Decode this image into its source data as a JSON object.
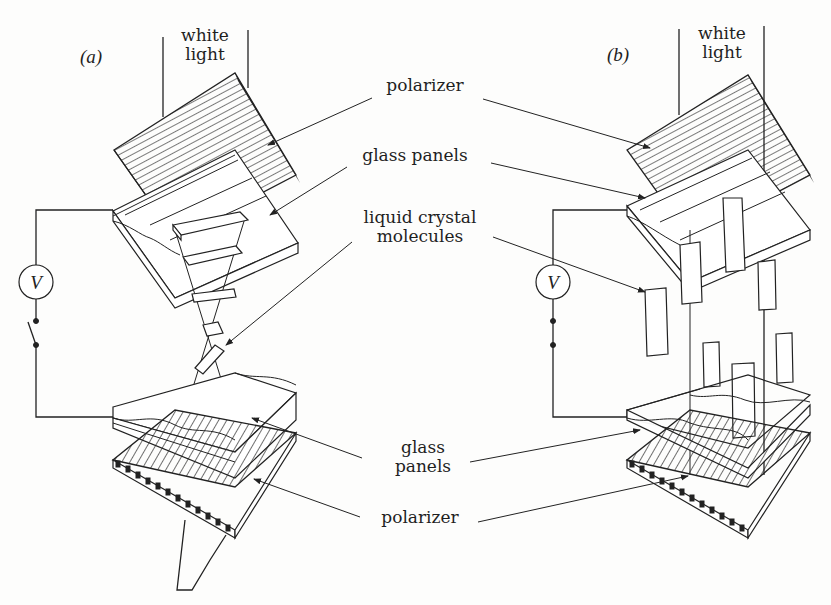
{
  "figure": {
    "panels": [
      {
        "id": "a",
        "tag": "(a)",
        "light_label": [
          "white",
          "light"
        ],
        "switch_state": "open",
        "meter": "V"
      },
      {
        "id": "b",
        "tag": "(b)",
        "light_label": [
          "white",
          "light"
        ],
        "switch_state": "closed",
        "meter": "V"
      }
    ],
    "labels": {
      "top_polarizer": "polarizer",
      "top_glass": "glass panels",
      "molecules_line1": "liquid crystal",
      "molecules_line2": "molecules",
      "bottom_glass_line1": "glass",
      "bottom_glass_line2": "panels",
      "bottom_polarizer": "polarizer"
    },
    "colors": {
      "ink": "#222222",
      "paper": "#fdfdfc"
    }
  }
}
